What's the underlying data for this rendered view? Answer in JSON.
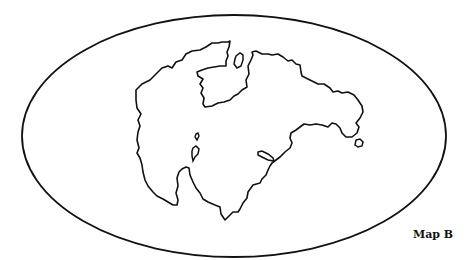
{
  "map": {
    "label": "Map B",
    "projection": "oval world outline",
    "stroke_color": "#111111",
    "background_color": "#ffffff",
    "features": [
      "continental-landmass",
      "inland-sea-northwest",
      "island-north",
      "island-east",
      "island-west-small",
      "island-west-large",
      "island-south-elongated"
    ]
  }
}
